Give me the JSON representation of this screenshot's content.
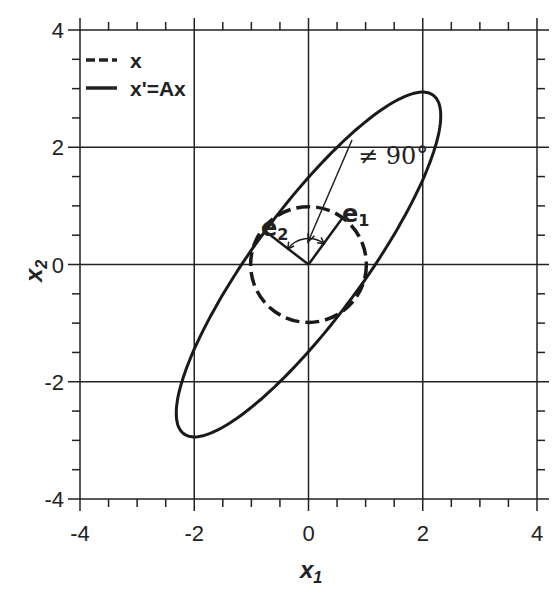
{
  "chart_data": {
    "type": "line",
    "title": "",
    "xlabel": "x1",
    "ylabel": "x2",
    "xlim": [
      -4,
      4
    ],
    "ylim": [
      -4,
      4
    ],
    "grid": true,
    "major_ticks": [
      -4,
      -2,
      0,
      2,
      4
    ],
    "minor_tick_step": 0.5,
    "x_tick_labels": [
      "-4",
      "-2",
      "0",
      "2",
      "4"
    ],
    "y_tick_labels": [
      "-4",
      "-2",
      "0",
      "2",
      "4"
    ],
    "legend_position": "upper left",
    "series": [
      {
        "name": "x",
        "style": "dashed",
        "shape": "circle",
        "center": [
          0,
          0
        ],
        "radius": 1.0
      },
      {
        "name": "x'=Ax",
        "style": "solid",
        "shape": "ellipse",
        "center": [
          0,
          0
        ],
        "extreme_points": {
          "top": [
            2.0,
            3.15
          ],
          "bottom": [
            -2.0,
            -3.15
          ],
          "right": [
            2.3,
            2.1
          ],
          "left": [
            -2.3,
            -2.1
          ]
        }
      }
    ],
    "annotations": [
      {
        "label": "e1",
        "type": "vector",
        "from": [
          0,
          0
        ],
        "to": [
          0.6,
          0.8
        ]
      },
      {
        "label": "e2",
        "type": "vector",
        "from": [
          0,
          0
        ],
        "to": [
          -0.8,
          0.6
        ]
      },
      {
        "label": "≠ 90°",
        "type": "arrow-callout",
        "text_at": [
          1.2,
          2.2
        ],
        "points_to": [
          0,
          0.35
        ]
      }
    ]
  },
  "legend": {
    "items": [
      {
        "label": "x",
        "style": "dashed"
      },
      {
        "label": "x'=Ax",
        "style": "solid"
      }
    ]
  },
  "axes": {
    "x_title": "x",
    "x_title_sub": "1",
    "y_title": "x",
    "y_title_sub": "2"
  },
  "labels": {
    "angle": "≠ 90°",
    "e1_main": "e",
    "e1_sub": "1",
    "e2_main": "e",
    "e2_sub": "2"
  },
  "colors": {
    "ink": "#1a1a1a",
    "background": "#ffffff"
  }
}
